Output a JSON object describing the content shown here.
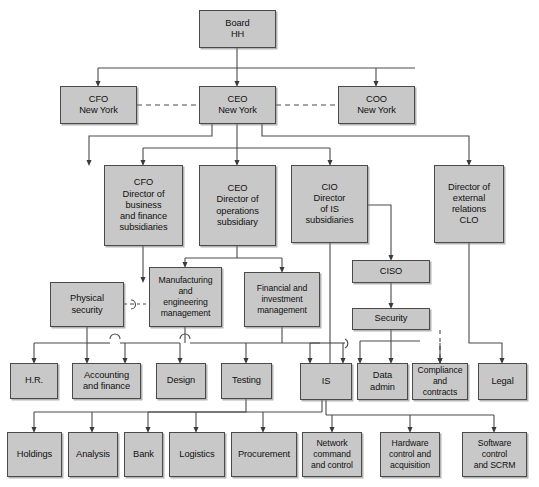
{
  "diagram": {
    "box_fill": "#c8c8c8",
    "box_border": "#4a4a4a",
    "line_color": "#4a4a4a"
  },
  "nodes": {
    "board": "Board\nHH",
    "cfo_ny": "CFO\nNew York",
    "ceo_ny": "CEO\nNew York",
    "coo_ny": "COO\nNew York",
    "cfo_director": "CFO\nDirector of\nbusiness\nand finance\nsubsidiaries",
    "ceo_director": "CEO\nDirector of\noperations\nsubsidiary",
    "cio_director": "CIO\nDirector\nof IS\nsubsidiaries",
    "director_external": "Director of\nexternal\nrelations\nCLO",
    "physical_security": "Physical\nsecurity",
    "manufacturing": "Manufacturing\nand\nengineering\nmanagement",
    "financial_investment": "Financial and\ninvestment\nmanagement",
    "ciso": "CISO",
    "security": "Security",
    "hr": "H.R.",
    "accounting": "Accounting\nand finance",
    "design": "Design",
    "testing": "Testing",
    "is": "IS",
    "data_admin": "Data\nadmin",
    "compliance": "Compliance\nand\ncontracts",
    "legal": "Legal",
    "holdings": "Holdings",
    "analysis": "Analysis",
    "bank": "Bank",
    "logistics": "Logistics",
    "procurement": "Procurement",
    "network_cc": "Network\ncommand\nand control",
    "hardware_ca": "Hardware\ncontrol and\nacquisition",
    "software_scrm": "Software\ncontrol\nand SCRM"
  }
}
